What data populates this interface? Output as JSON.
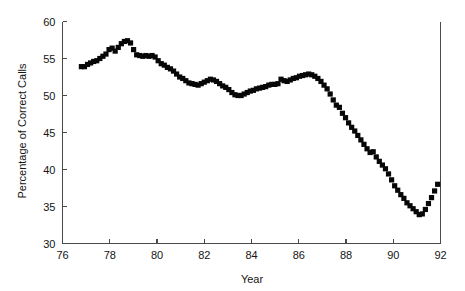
{
  "chart_data": {
    "type": "scatter",
    "title": "",
    "xlabel": "Year",
    "ylabel": "Percentage of Correct Calls",
    "xlim": [
      76,
      92
    ],
    "ylim": [
      30,
      60
    ],
    "xticks": [
      76,
      78,
      80,
      82,
      84,
      86,
      88,
      90,
      92
    ],
    "xtick_labels": [
      "76",
      "78",
      "80",
      "82",
      "84",
      "86",
      "88",
      "90",
      "92"
    ],
    "yticks": [
      30,
      35,
      40,
      45,
      50,
      55,
      60
    ],
    "ytick_labels": [
      "30",
      "35",
      "40",
      "45",
      "50",
      "55",
      "60"
    ],
    "grid": false,
    "legend": null,
    "marker": "filled-square",
    "marker_color": "#070707",
    "series": [
      {
        "name": "Percentage of Correct Calls",
        "x": [
          76.8,
          76.93,
          77.06,
          77.19,
          77.32,
          77.45,
          77.58,
          77.71,
          77.84,
          77.97,
          78.1,
          78.23,
          78.36,
          78.49,
          78.62,
          78.75,
          78.88,
          79.01,
          79.14,
          79.27,
          79.4,
          79.53,
          79.66,
          79.79,
          79.92,
          80.05,
          80.18,
          80.31,
          80.44,
          80.57,
          80.7,
          80.83,
          80.96,
          81.09,
          81.22,
          81.35,
          81.48,
          81.61,
          81.74,
          81.87,
          82.0,
          82.13,
          82.26,
          82.39,
          82.52,
          82.65,
          82.78,
          82.91,
          83.04,
          83.17,
          83.3,
          83.43,
          83.56,
          83.69,
          83.82,
          83.95,
          84.08,
          84.21,
          84.34,
          84.47,
          84.6,
          84.73,
          84.86,
          84.99,
          85.12,
          85.25,
          85.38,
          85.51,
          85.64,
          85.77,
          85.9,
          86.03,
          86.16,
          86.29,
          86.42,
          86.55,
          86.68,
          86.81,
          86.94,
          87.07,
          87.2,
          87.33,
          87.46,
          87.59,
          87.72,
          87.85,
          87.98,
          88.11,
          88.24,
          88.37,
          88.5,
          88.63,
          88.76,
          88.89,
          89.02,
          89.15,
          89.28,
          89.41,
          89.54,
          89.67,
          89.8,
          89.93,
          90.06,
          90.19,
          90.32,
          90.45,
          90.58,
          90.71,
          90.84,
          90.97,
          91.1,
          91.23,
          91.36,
          91.49,
          91.62,
          91.75,
          91.88
        ],
        "y": [
          53.9,
          53.9,
          54.2,
          54.4,
          54.6,
          54.7,
          55.0,
          55.3,
          55.6,
          56.2,
          56.4,
          56.0,
          56.5,
          57.0,
          57.3,
          57.4,
          57.1,
          56.2,
          55.5,
          55.4,
          55.3,
          55.4,
          55.3,
          55.4,
          55.2,
          54.7,
          54.3,
          54.1,
          53.8,
          53.6,
          53.3,
          52.9,
          52.5,
          52.3,
          52.0,
          51.7,
          51.6,
          51.5,
          51.4,
          51.6,
          51.8,
          52.0,
          52.2,
          52.1,
          51.9,
          51.6,
          51.3,
          51.1,
          50.8,
          50.4,
          50.1,
          50.0,
          50.0,
          50.2,
          50.4,
          50.6,
          50.7,
          50.9,
          51.0,
          51.1,
          51.2,
          51.4,
          51.5,
          51.5,
          51.6,
          52.2,
          52.0,
          51.9,
          52.1,
          52.3,
          52.4,
          52.6,
          52.7,
          52.8,
          52.9,
          52.8,
          52.6,
          52.3,
          51.9,
          51.4,
          50.9,
          50.2,
          49.4,
          48.7,
          48.4,
          47.6,
          47.0,
          46.3,
          45.7,
          45.2,
          44.6,
          44.0,
          43.4,
          42.8,
          42.3,
          42.4,
          41.7,
          41.1,
          40.6,
          40.1,
          39.4,
          38.6,
          37.8,
          37.2,
          36.6,
          36.1,
          35.5,
          35.1,
          34.7,
          34.3,
          33.9,
          34.0,
          34.6,
          35.4,
          36.2,
          37.1,
          38.0
        ]
      }
    ]
  },
  "figure": {
    "background_color": "#ffffff",
    "axis_color": "#4a4a4a",
    "text_color": "#141414"
  }
}
